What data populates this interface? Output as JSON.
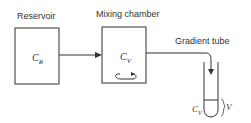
{
  "diagram": {
    "reservoir": {
      "title": "Reservoir",
      "symbol": "C",
      "subscript": "R"
    },
    "mixing_chamber": {
      "title": "Mixing chamber",
      "symbol": "C",
      "subscript": "V"
    },
    "gradient_tube": {
      "title": "Gradient tube",
      "symbol": "C",
      "subscript": "V",
      "volume_label": "V"
    }
  }
}
